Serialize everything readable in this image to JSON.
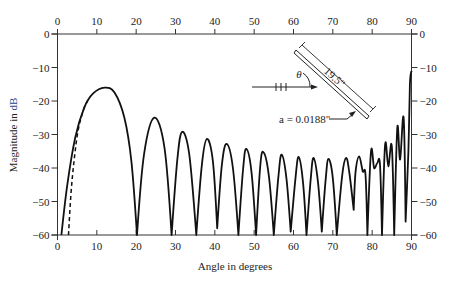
{
  "chart_data": {
    "type": "line",
    "title": "",
    "xlabel": "Angle in degrees",
    "ylabel": "Magnitude in dB",
    "ylabel_highlight": "dB",
    "xlim": [
      0,
      90
    ],
    "ylim": [
      -60,
      0
    ],
    "x_ticks": [
      0,
      10,
      20,
      30,
      40,
      50,
      60,
      70,
      80,
      90
    ],
    "y_ticks": [
      0,
      -10,
      -20,
      -30,
      -40,
      -50,
      -60
    ],
    "x_tick_labels": [
      "0",
      "10",
      "20",
      "30",
      "40",
      "50",
      "60",
      "70",
      "80",
      "90"
    ],
    "y_tick_labels": [
      "0",
      "−10",
      "−20",
      "−30",
      "−40",
      "−50",
      "−60"
    ],
    "grid": false,
    "axes_mirrored": true,
    "series": [
      {
        "name": "solid",
        "style": "solid",
        "x": [
          1.0,
          2.5,
          4.5,
          6.8,
          9.0,
          12.0,
          14.5,
          17.0,
          18.8,
          20.2,
          22.0,
          24.6,
          27.2,
          29.0,
          30.5,
          31.7,
          33.5,
          35.3,
          36.7,
          38.0,
          39.5,
          40.6,
          41.8,
          43.0,
          44.6,
          46.0,
          47.2,
          48.0,
          49.3,
          50.5,
          51.5,
          52.3,
          53.7,
          55.0,
          56.2,
          57.0,
          58.2,
          59.3,
          60.5,
          61.3,
          62.4,
          63.3,
          64.4,
          65.1,
          66.2,
          67.2,
          68.2,
          68.9,
          70.0,
          71.0,
          72.4,
          73.4,
          74.2,
          75.3,
          75.8,
          76.7,
          77.6,
          78.3,
          78.8,
          79.7,
          80.5,
          81.3,
          82.0,
          82.5,
          83.3,
          84.1,
          85.0,
          85.6,
          86.4,
          87.1,
          88.0,
          88.5,
          89.2,
          89.6,
          90.0
        ],
        "y": [
          -60,
          -45,
          -31,
          -22,
          -17.8,
          -16.0,
          -17.5,
          -25,
          -38,
          -60,
          -36,
          -25.0,
          -34,
          -60,
          -37,
          -29.2,
          -36,
          -60,
          -39,
          -31.3,
          -38,
          -58,
          -39,
          -32.8,
          -40,
          -60,
          -40,
          -34.3,
          -41,
          -60,
          -40,
          -35.2,
          -42,
          -60,
          -42,
          -36.0,
          -43,
          -59,
          -43,
          -36.7,
          -44,
          -60,
          -43,
          -37.0,
          -44,
          -59,
          -43,
          -37.3,
          -43,
          -60,
          -42,
          -37.0,
          -41.5,
          -52.5,
          -41,
          -36.5,
          -41,
          -42,
          -60,
          -35,
          -40,
          -38.5,
          -39,
          -60,
          -33,
          -39.5,
          -33.5,
          -60,
          -28,
          -37.5,
          -25,
          -56,
          -35,
          -15,
          -11
        ]
      },
      {
        "name": "dashed",
        "style": "dashed",
        "x": [
          2.8,
          3.4,
          4.2,
          5.2,
          6.5,
          7.8
        ],
        "y": [
          -60,
          -48,
          -38,
          -29,
          -23,
          -19.5
        ]
      }
    ],
    "annotations": {
      "rod_length": "19.5\"",
      "radius": "a = 0.0188\"",
      "angle_symbol": "θ"
    }
  }
}
